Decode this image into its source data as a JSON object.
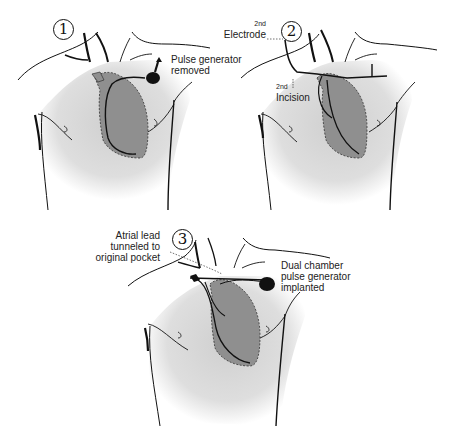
{
  "diagram": {
    "colors": {
      "skin_shade": "#d4d4d4",
      "heart_fill": "#8f8f8f",
      "heart_shadow": "#a8a8a8",
      "outline": "#111111",
      "device": "#111111"
    },
    "panels": [
      {
        "step": "1",
        "labels": [
          {
            "id": "pulse-generator-removed",
            "lines": [
              "Pulse generator",
              "removed"
            ]
          }
        ]
      },
      {
        "step": "2",
        "labels": [
          {
            "id": "second-electrode",
            "sup": "2nd",
            "text": "Electrode"
          },
          {
            "id": "second-incision",
            "sup": "2nd",
            "text": "Incision"
          }
        ]
      },
      {
        "step": "3",
        "labels": [
          {
            "id": "atrial-lead-tunneled",
            "lines": [
              "Atrial lead",
              "tunneled to",
              "original pocket"
            ]
          },
          {
            "id": "dual-chamber-implanted",
            "lines": [
              "Dual chamber",
              "pulse generator",
              "implanted"
            ]
          }
        ]
      }
    ]
  }
}
